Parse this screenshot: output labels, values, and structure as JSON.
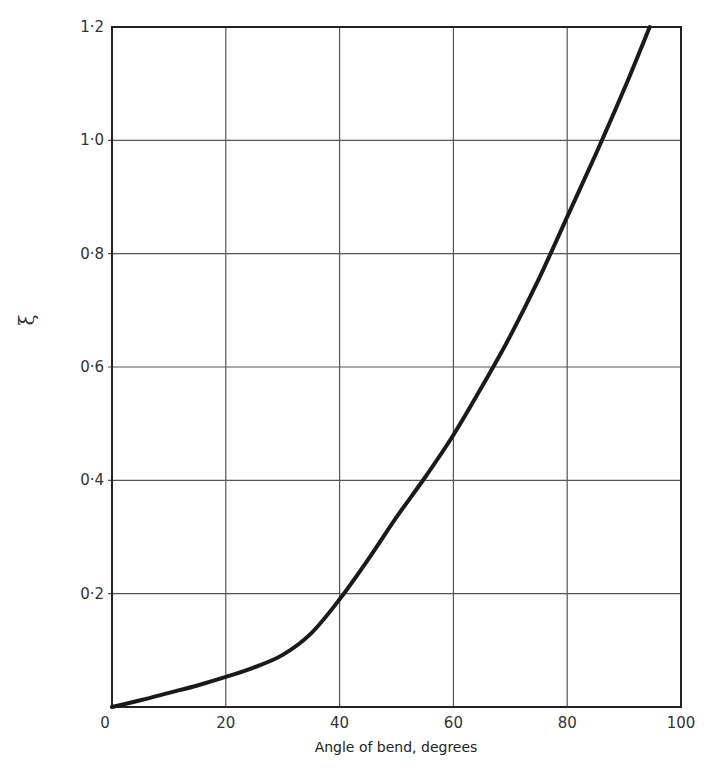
{
  "chart_data": {
    "type": "line",
    "title": "",
    "xlabel": "Angle of bend,  degrees",
    "ylabel": "ξ",
    "xlim": [
      0,
      100
    ],
    "ylim": [
      0,
      1.2
    ],
    "grid": true,
    "legend": null,
    "x_ticks": [
      0,
      20,
      40,
      60,
      80,
      100
    ],
    "x_tick_labels": [
      "0",
      "20",
      "40",
      "60",
      "80",
      "100"
    ],
    "y_ticks": [
      0.2,
      0.4,
      0.6,
      0.8,
      1.0,
      1.2
    ],
    "y_tick_labels": [
      "0·2",
      "0·4",
      "0·6",
      "0·8",
      "1·0",
      "1·2"
    ],
    "x_grid": [
      20,
      40,
      60,
      80
    ],
    "y_grid": [
      0.2,
      0.4,
      0.6,
      0.8,
      1.0
    ],
    "series": [
      {
        "name": "ξ",
        "x": [
          0,
          5,
          10,
          15,
          20,
          25,
          30,
          35,
          40,
          45,
          50,
          55,
          60,
          65,
          70,
          75,
          80,
          85,
          90,
          94.5
        ],
        "y": [
          0,
          0.012,
          0.025,
          0.038,
          0.053,
          0.07,
          0.092,
          0.13,
          0.19,
          0.26,
          0.335,
          0.405,
          0.48,
          0.565,
          0.655,
          0.755,
          0.865,
          0.975,
          1.09,
          1.2
        ]
      }
    ],
    "colors": {
      "line": "#1a1a1a",
      "grid": "#555555",
      "frame": "#222222"
    }
  }
}
